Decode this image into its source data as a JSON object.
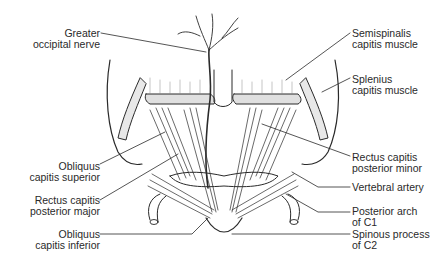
{
  "diagram": {
    "type": "anatomical-illustration",
    "labels_left": [
      {
        "id": "greater-occipital-nerve",
        "lines": [
          "Greater",
          "occipital nerve"
        ]
      },
      {
        "id": "obliquus-capitis-superior",
        "lines": [
          "Obliquus",
          "capitis superior"
        ]
      },
      {
        "id": "rectus-capitis-posterior-major",
        "lines": [
          "Rectus capitis",
          "posterior major"
        ]
      },
      {
        "id": "obliquus-capitis-inferior",
        "lines": [
          "Obliquus",
          "capitis inferior"
        ]
      }
    ],
    "labels_right": [
      {
        "id": "semispinalis-capitis-muscle",
        "lines": [
          "Semispinalis",
          "capitis muscle"
        ]
      },
      {
        "id": "splenius-capitis-muscle",
        "lines": [
          "Splenius",
          "capitis muscle"
        ]
      },
      {
        "id": "rectus-capitis-posterior-minor",
        "lines": [
          "Rectus capitis",
          "posterior minor"
        ]
      },
      {
        "id": "vertebral-artery",
        "lines": [
          "Vertebral artery"
        ]
      },
      {
        "id": "posterior-arch-of-c1",
        "lines": [
          "Posterior arch",
          "of C1"
        ]
      },
      {
        "id": "spinous-process-of-c2",
        "lines": [
          "Spinous process",
          "of C2"
        ]
      }
    ],
    "colors": {
      "ink": "#2a2a2a",
      "background": "#ffffff"
    }
  }
}
